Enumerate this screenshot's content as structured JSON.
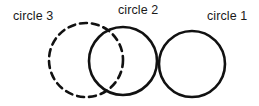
{
  "figure": {
    "width": 259,
    "height": 106,
    "background_color": "#ffffff",
    "stroke_color": "#111111",
    "text_color": "#1a1a1a",
    "labels": [
      {
        "id": "circle-3",
        "text": "circle 3",
        "x": 13,
        "y": 10
      },
      {
        "id": "circle-2",
        "text": "circle 2",
        "x": 118,
        "y": 4
      },
      {
        "id": "circle-1",
        "text": "circle 1",
        "x": 207,
        "y": 10
      }
    ],
    "shapes": [
      {
        "id": "circle-3",
        "name": "circle 3",
        "style": "dashed",
        "cx": 86,
        "cy": 60,
        "r": 37,
        "stroke_width": 2.6,
        "dash_pattern": "7 5"
      },
      {
        "id": "circle-2",
        "name": "circle 2",
        "style": "solid",
        "cx": 123,
        "cy": 61,
        "r": 34,
        "stroke_width": 2.6,
        "dash_pattern": ""
      },
      {
        "id": "circle-1",
        "name": "circle 1",
        "style": "solid",
        "cx": 192,
        "cy": 64,
        "r": 33,
        "stroke_width": 2.6,
        "dash_pattern": ""
      }
    ]
  }
}
